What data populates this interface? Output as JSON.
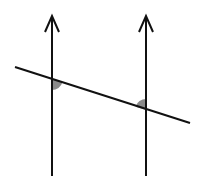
{
  "diagram": {
    "canvas": {
      "width": 206,
      "height": 179,
      "background": "#ffffff"
    },
    "colors": {
      "line": "#111111",
      "angle_fill": "#8a8a8a"
    },
    "parallel_lines": [
      {
        "id": "left",
        "x": 52,
        "y_top": 15,
        "y_bottom": 176,
        "arrow": "up"
      },
      {
        "id": "right",
        "x": 146,
        "y_top": 15,
        "y_bottom": 176,
        "arrow": "up"
      }
    ],
    "transversal": {
      "x1": 15,
      "y1": 67,
      "x2": 190,
      "y2": 123
    },
    "marked_angles": [
      {
        "id": "angle-left",
        "vertex": [
          52,
          79
        ],
        "position": "below-right",
        "radius": 11
      },
      {
        "id": "angle-right",
        "vertex": [
          146,
          110
        ],
        "position": "above-left",
        "radius": 11
      }
    ]
  }
}
